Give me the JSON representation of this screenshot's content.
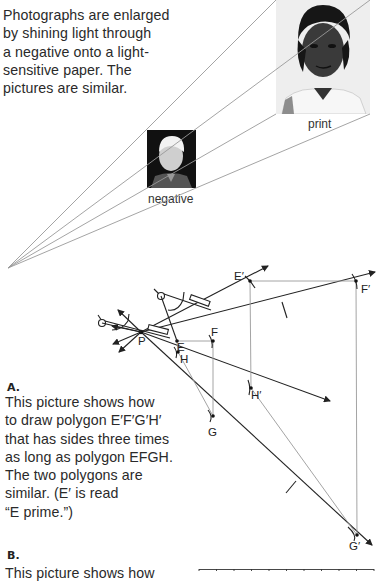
{
  "intro": {
    "lines": [
      "Photographs are enlarged",
      "by shining light through",
      "a negative onto a light-",
      "sensitive paper. The",
      "pictures are similar."
    ]
  },
  "photos": {
    "negative_label": "negative",
    "print_label": "print"
  },
  "section_a": {
    "heading": "A.",
    "lines": [
      "This picture shows how",
      "to draw polygon E′F′G′H′",
      "that has sides three times",
      "as long as polygon EFGH.",
      "The two polygons are",
      "similar. (E′ is read",
      "“E prime.”)"
    ]
  },
  "section_b": {
    "heading": "B.",
    "first_line_partial": "This picture shows how"
  },
  "diagram": {
    "points": {
      "P": "P",
      "E": "E",
      "F": "F",
      "G": "G",
      "H": "H",
      "E_prime": "E′",
      "F_prime": "F′",
      "G_prime": "G′",
      "H_prime": "H′"
    },
    "scale_factor": "3"
  },
  "grid": {
    "columns": 10
  },
  "colors": {
    "line_dark": "#222222",
    "line_gray": "#9a9a9a",
    "text": "#2a2a2a"
  }
}
